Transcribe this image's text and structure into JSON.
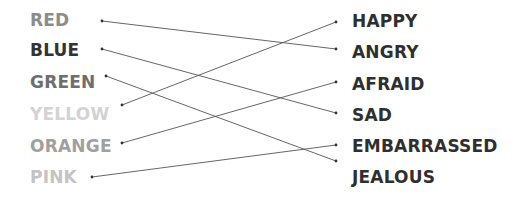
{
  "left_items": [
    {
      "label": "RED",
      "color": "#8c8c8c",
      "y": 10,
      "dot": [
        102,
        21
      ]
    },
    {
      "label": "BLUE",
      "color": "#333333",
      "y": 40,
      "dot": [
        102,
        49
      ]
    },
    {
      "label": "GREEN",
      "color": "#6e6e6e",
      "y": 72,
      "dot": [
        106,
        76
      ]
    },
    {
      "label": "YELLOW",
      "color": "#d3d3d3",
      "y": 104,
      "dot": [
        122,
        105
      ]
    },
    {
      "label": "ORANGE",
      "color": "#a0a0a0",
      "y": 136,
      "dot": [
        122,
        143
      ]
    },
    {
      "label": "PINK",
      "color": "#c4c4c4",
      "y": 167,
      "dot": [
        92,
        177
      ]
    }
  ],
  "right_items": [
    {
      "label": "HAPPY",
      "y": 11,
      "dot": [
        336,
        22
      ]
    },
    {
      "label": "ANGRY",
      "y": 42,
      "dot": [
        336,
        49
      ]
    },
    {
      "label": "AFRAID",
      "y": 74,
      "dot": [
        336,
        82
      ]
    },
    {
      "label": "SAD",
      "y": 105,
      "dot": [
        336,
        113
      ]
    },
    {
      "label": "EMBARRASSED",
      "y": 136,
      "dot": [
        336,
        145
      ]
    },
    {
      "label": "JEALOUS",
      "y": 167,
      "dot": [
        336,
        161
      ]
    }
  ],
  "connections": [
    {
      "from": "RED",
      "to": "ANGRY"
    },
    {
      "from": "BLUE",
      "to": "SAD"
    },
    {
      "from": "GREEN",
      "to": "JEALOUS"
    },
    {
      "from": "YELLOW",
      "to": "HAPPY"
    },
    {
      "from": "ORANGE",
      "to": "AFRAID"
    },
    {
      "from": "PINK",
      "to": "EMBARRASSED"
    }
  ],
  "line_color": "#555555"
}
